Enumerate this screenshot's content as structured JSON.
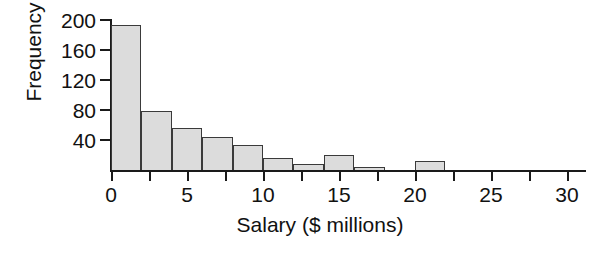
{
  "chart_data": {
    "type": "bar",
    "title": "",
    "subtitle": "",
    "xlabel": "Salary ($ millions)",
    "ylabel": "Frequency",
    "xlim": [
      0,
      32
    ],
    "ylim": [
      0,
      200
    ],
    "grid": false,
    "legend": false,
    "bin_width": 2,
    "bin_edges": [
      0,
      2,
      4,
      6,
      8,
      10,
      12,
      14,
      16,
      18,
      20,
      22
    ],
    "categories": [
      "0-2",
      "2-4",
      "4-6",
      "6-8",
      "8-10",
      "10-12",
      "12-14",
      "14-16",
      "16-18",
      "18-20",
      "20-22"
    ],
    "values": [
      195,
      80,
      57,
      45,
      35,
      18,
      10,
      22,
      5,
      2,
      13
    ],
    "x_tick_values": [
      0,
      5,
      10,
      15,
      20,
      25,
      30
    ],
    "x_tick_labels": [
      "0",
      "5",
      "10",
      "15",
      "20",
      "25",
      "30"
    ],
    "x_minor_tick_values": [
      0,
      2.5,
      5,
      7.5,
      10,
      12.5,
      15,
      17.5,
      20,
      22.5,
      25,
      27.5,
      30,
      32.5
    ],
    "y_tick_values": [
      40,
      80,
      120,
      160,
      200
    ],
    "y_tick_labels": [
      "40",
      "80",
      "120",
      "160",
      "200"
    ],
    "bar_fill_color": "#dcdcdc",
    "bar_edge_color": "#3a3a3a",
    "axis_color": "#1a1a1a",
    "background_color": "#ffffff"
  }
}
